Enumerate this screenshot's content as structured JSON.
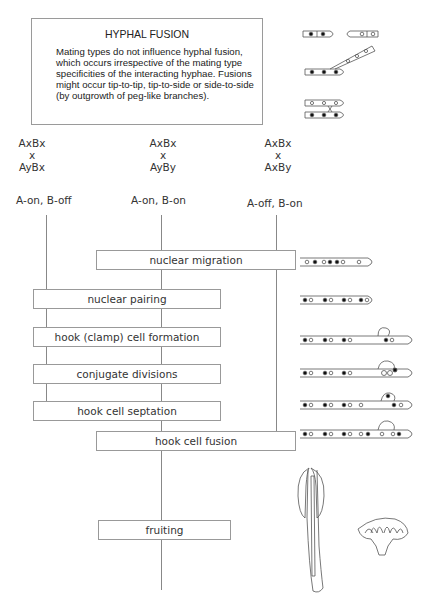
{
  "infobox": {
    "title": "HYPHAL FUSION",
    "body": "Mating types do not influence hyphal fusion, which occurs irrespective of the mating type specificities of the interacting hyphae. Fusions might occur tip-to-tip, tip-to-side or side-to-side (by outgrowth of peg-like branches)."
  },
  "crosses": [
    {
      "parent1": "AxBx",
      "sep": "x",
      "parent2": "AyBx",
      "state": "A-on, B-off"
    },
    {
      "parent1": "AxBx",
      "sep": "x",
      "parent2": "AyBy",
      "state": "A-on, B-on"
    },
    {
      "parent1": "AxBx",
      "sep": "x",
      "parent2": "AxBy",
      "state": "A-off, B-on"
    }
  ],
  "steps": [
    {
      "label": "nuclear migration"
    },
    {
      "label": "nuclear pairing"
    },
    {
      "label": "hook (clamp) cell formation"
    },
    {
      "label": "conjugate divisions"
    },
    {
      "label": "hook cell septation"
    },
    {
      "label": "hook cell fusion"
    },
    {
      "label": "fruiting"
    }
  ],
  "illustrations": {
    "fusion_icon": "hyphal-fusion-diagrams-icon",
    "hypha_icon": "hypha-with-nuclei-icon",
    "fruiting_body_icon": "mushroom-section-icon",
    "gill_icon": "mushroom-cap-gills-icon"
  },
  "colors": {
    "line": "#888888",
    "box_border": "#999999",
    "text": "#333333"
  }
}
